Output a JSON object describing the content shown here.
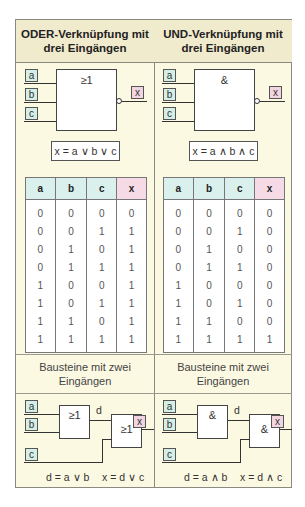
{
  "columns": [
    {
      "title_line1": "ODER-Verknüpfung mit",
      "title_line2": "drei Eingängen",
      "gate_symbol": "≥1",
      "inputs": [
        "a",
        "b",
        "c"
      ],
      "output": "x",
      "formula": "x = a ∨ b ∨ c",
      "table": {
        "headers": [
          "a",
          "b",
          "c",
          "x"
        ],
        "rows": [
          [
            "0",
            "0",
            "0",
            "0"
          ],
          [
            "0",
            "0",
            "1",
            "1"
          ],
          [
            "0",
            "1",
            "0",
            "1"
          ],
          [
            "0",
            "1",
            "1",
            "1"
          ],
          [
            "1",
            "0",
            "0",
            "1"
          ],
          [
            "1",
            "0",
            "1",
            "1"
          ],
          [
            "1",
            "1",
            "0",
            "1"
          ],
          [
            "1",
            "1",
            "1",
            "1"
          ]
        ]
      },
      "sub_line1": "Bausteine mit zwei",
      "sub_line2": "Eingängen",
      "two_input": {
        "gate1_symbol": "≥1",
        "gate2_symbol": "≥1",
        "intermediate": "d",
        "eq1": "d = a ∨ b",
        "eq2": "x = d ∨ c"
      }
    },
    {
      "title_line1": "UND-Verknüpfung mit",
      "title_line2": "drei Eingängen",
      "gate_symbol": "&",
      "inputs": [
        "a",
        "b",
        "c"
      ],
      "output": "x",
      "formula": "x = a ∧ b ∧ c",
      "table": {
        "headers": [
          "a",
          "b",
          "c",
          "x"
        ],
        "rows": [
          [
            "0",
            "0",
            "0",
            "0"
          ],
          [
            "0",
            "0",
            "1",
            "0"
          ],
          [
            "0",
            "1",
            "0",
            "0"
          ],
          [
            "0",
            "1",
            "1",
            "0"
          ],
          [
            "1",
            "0",
            "0",
            "0"
          ],
          [
            "1",
            "0",
            "1",
            "0"
          ],
          [
            "1",
            "1",
            "0",
            "0"
          ],
          [
            "1",
            "1",
            "1",
            "1"
          ]
        ]
      },
      "sub_line1": "Bausteine mit zwei",
      "sub_line2": "Eingängen",
      "two_input": {
        "gate1_symbol": "&",
        "gate2_symbol": "&",
        "intermediate": "d",
        "eq1": "d = a ∧ b",
        "eq2": "x = d ∧ c"
      }
    }
  ],
  "colors": {
    "background": "#fcf9e3",
    "header": "#f1ebce",
    "input_label": "#d5eee6",
    "output_label": "#f1d6e2"
  }
}
